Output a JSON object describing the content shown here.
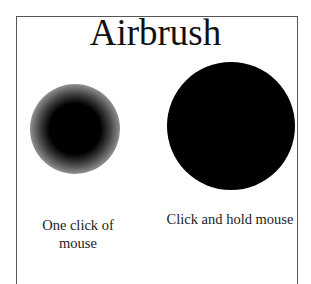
{
  "title": "Airbrush",
  "examples": [
    {
      "caption_line1": "One click of",
      "caption_line2": "mouse",
      "size": "small"
    },
    {
      "caption_line1": "Click and hold mouse",
      "size": "large"
    }
  ],
  "colors": {
    "ink": "#000000",
    "border": "#555555",
    "background": "#ffffff"
  }
}
